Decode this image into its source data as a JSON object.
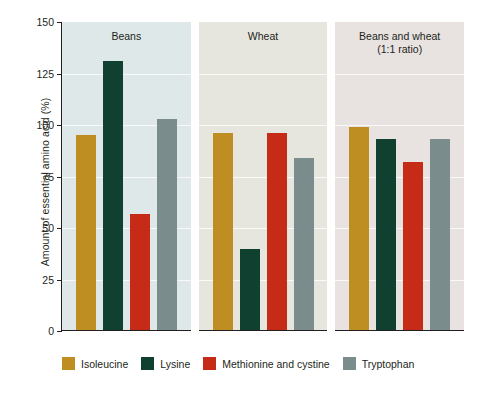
{
  "chart_data": {
    "type": "bar",
    "title": "",
    "xlabel": "",
    "ylabel": "Amount of essential amino acid (%)",
    "ylim": [
      0,
      150
    ],
    "yticks": [
      0,
      25,
      50,
      75,
      100,
      125,
      150
    ],
    "grid": true,
    "legend_position": "bottom",
    "panels": [
      "Beans",
      "Beans and wheat (1:1 ratio)",
      "Wheat"
    ],
    "categories": [
      "Beans",
      "Wheat",
      "Beans and wheat (1:1 ratio)"
    ],
    "series": [
      {
        "name": "Isoleucine",
        "color": "#bf8e22",
        "values": [
          95,
          96,
          99
        ]
      },
      {
        "name": "Lysine",
        "color": "#10402f",
        "values": [
          131,
          40,
          93
        ]
      },
      {
        "name": "Methionine and cystine",
        "color": "#c62b18",
        "values": [
          57,
          96,
          82
        ]
      },
      {
        "name": "Tryptophan",
        "color": "#7b8c8c",
        "values": [
          103,
          84,
          93
        ]
      }
    ]
  },
  "axis": {
    "y_title": "Amount of essential amino acid (%)",
    "ticks": [
      {
        "label": "150",
        "value": 150
      },
      {
        "label": "125",
        "value": 125
      },
      {
        "label": "100",
        "value": 100
      },
      {
        "label": "75",
        "value": 75
      },
      {
        "label": "50",
        "value": 50
      },
      {
        "label": "25",
        "value": 25
      },
      {
        "label": "0",
        "value": 0
      }
    ]
  },
  "panels": [
    {
      "title": "Beans",
      "title_line1": "Beans",
      "title_line2": "",
      "background": "#dee8e8",
      "bars": [
        {
          "series": "Isoleucine",
          "value": 95,
          "color": "#bf8e22"
        },
        {
          "series": "Lysine",
          "value": 131,
          "color": "#10402f"
        },
        {
          "series": "Methionine and cystine",
          "value": 57,
          "color": "#c62b18"
        },
        {
          "series": "Tryptophan",
          "value": 103,
          "color": "#7b8c8c"
        }
      ]
    },
    {
      "title": "Wheat",
      "title_line1": "Wheat",
      "title_line2": "",
      "background": "#e6e6df",
      "bars": [
        {
          "series": "Isoleucine",
          "value": 96,
          "color": "#bf8e22"
        },
        {
          "series": "Lysine",
          "value": 40,
          "color": "#10402f"
        },
        {
          "series": "Methionine and cystine",
          "value": 96,
          "color": "#c62b18"
        },
        {
          "series": "Tryptophan",
          "value": 84,
          "color": "#7b8c8c"
        }
      ]
    },
    {
      "title": "Beans and wheat (1:1 ratio)",
      "title_line1": "Beans and wheat",
      "title_line2": "(1:1 ratio)",
      "background": "#e8e3e0",
      "bars": [
        {
          "series": "Isoleucine",
          "value": 99,
          "color": "#bf8e22"
        },
        {
          "series": "Lysine",
          "value": 93,
          "color": "#10402f"
        },
        {
          "series": "Methionine and cystine",
          "value": 82,
          "color": "#c62b18"
        },
        {
          "series": "Tryptophan",
          "value": 93,
          "color": "#7b8c8c"
        }
      ]
    }
  ],
  "legend": [
    {
      "label": "Isoleucine",
      "color": "#bf8e22"
    },
    {
      "label": "Lysine",
      "color": "#10402f"
    },
    {
      "label": "Methionine and cystine",
      "color": "#c62b18"
    },
    {
      "label": "Tryptophan",
      "color": "#7b8c8c"
    }
  ]
}
